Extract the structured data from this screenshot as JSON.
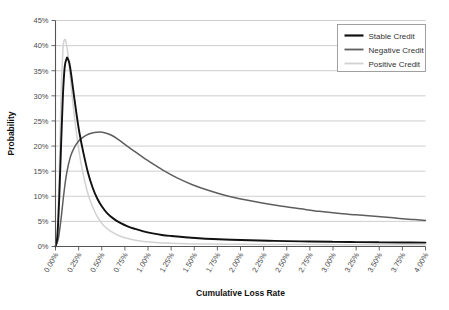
{
  "chart_data": {
    "type": "line",
    "title": "",
    "xlabel": "Cumulative Loss Rate",
    "ylabel": "Probability",
    "xlim": [
      0,
      4
    ],
    "ylim": [
      0,
      45
    ],
    "grid": "horizontal",
    "legend_position": "top-right",
    "x_tick_labels": [
      "0.00%",
      "0.25%",
      "0.50%",
      "0.75%",
      "1.00%",
      "1.25%",
      "1.50%",
      "1.75%",
      "2.00%",
      "2.25%",
      "2.50%",
      "2.75%",
      "3.00%",
      "3.25%",
      "3.50%",
      "3.75%",
      "4.00%"
    ],
    "x_tick_values": [
      0,
      0.25,
      0.5,
      0.75,
      1.0,
      1.25,
      1.5,
      1.75,
      2.0,
      2.25,
      2.5,
      2.75,
      3.0,
      3.25,
      3.5,
      3.75,
      4.0
    ],
    "y_tick_labels": [
      "0%",
      "5%",
      "10%",
      "15%",
      "20%",
      "25%",
      "30%",
      "35%",
      "40%",
      "45%"
    ],
    "y_tick_values": [
      0,
      5,
      10,
      15,
      20,
      25,
      30,
      35,
      40,
      45
    ],
    "series": [
      {
        "name": "Stable Credit",
        "color": "#111111",
        "width": 1.9,
        "peak_x": 0.13,
        "peak_y": 37.5,
        "x": [
          0.0,
          0.02,
          0.04,
          0.06,
          0.08,
          0.1,
          0.12,
          0.13,
          0.15,
          0.17,
          0.2,
          0.23,
          0.26,
          0.3,
          0.35,
          0.4,
          0.45,
          0.5,
          0.56,
          0.63,
          0.7,
          0.78,
          0.86,
          0.95,
          1.05,
          1.15,
          1.25,
          1.4,
          1.55,
          1.7,
          1.9,
          2.1,
          2.3,
          2.5,
          2.75,
          3.0,
          3.25,
          3.5,
          3.75,
          4.0
        ],
        "y": [
          0.0,
          2.0,
          9.5,
          20.0,
          30.0,
          35.8,
          37.4,
          37.5,
          36.5,
          34.2,
          30.0,
          26.0,
          22.5,
          18.8,
          14.8,
          11.8,
          9.6,
          8.0,
          6.6,
          5.5,
          4.7,
          4.0,
          3.5,
          3.0,
          2.6,
          2.3,
          2.1,
          1.85,
          1.65,
          1.5,
          1.35,
          1.25,
          1.15,
          1.08,
          1.0,
          0.93,
          0.88,
          0.83,
          0.8,
          0.78
        ]
      },
      {
        "name": "Negative Credit",
        "color": "#5e5e5e",
        "width": 1.5,
        "peak_x": 0.48,
        "peak_y": 22.8,
        "x": [
          0.0,
          0.03,
          0.06,
          0.09,
          0.12,
          0.16,
          0.2,
          0.25,
          0.3,
          0.36,
          0.42,
          0.48,
          0.54,
          0.6,
          0.68,
          0.76,
          0.85,
          0.95,
          1.05,
          1.18,
          1.32,
          1.48,
          1.65,
          1.85,
          2.05,
          2.25,
          2.45,
          2.65,
          2.85,
          3.05,
          3.25,
          3.45,
          3.65,
          3.85,
          4.0
        ],
        "y": [
          0.0,
          1.5,
          5.5,
          10.5,
          14.5,
          17.8,
          19.6,
          21.0,
          21.8,
          22.4,
          22.7,
          22.8,
          22.6,
          22.2,
          21.3,
          20.2,
          19.0,
          17.7,
          16.5,
          15.0,
          13.6,
          12.3,
          11.2,
          10.1,
          9.3,
          8.6,
          8.0,
          7.5,
          7.0,
          6.6,
          6.3,
          6.0,
          5.7,
          5.4,
          5.2
        ]
      },
      {
        "name": "Positive Credit",
        "color": "#d2d2d2",
        "width": 1.5,
        "peak_x": 0.1,
        "peak_y": 41.0,
        "x": [
          0.0,
          0.02,
          0.04,
          0.06,
          0.08,
          0.09,
          0.1,
          0.11,
          0.13,
          0.15,
          0.18,
          0.21,
          0.25,
          0.29,
          0.34,
          0.39,
          0.45,
          0.52,
          0.6,
          0.68,
          0.76,
          0.85,
          0.95,
          1.05,
          1.18,
          1.32,
          1.5,
          1.7,
          1.95,
          2.2,
          2.5,
          2.8,
          3.1,
          3.4,
          3.7,
          4.0
        ],
        "y": [
          0.0,
          3.0,
          14.0,
          30.0,
          39.0,
          40.8,
          41.2,
          41.0,
          39.0,
          35.5,
          30.0,
          25.0,
          19.5,
          15.2,
          11.2,
          8.4,
          6.0,
          4.2,
          3.0,
          2.2,
          1.7,
          1.3,
          1.0,
          0.85,
          0.7,
          0.6,
          0.52,
          0.48,
          0.45,
          0.42,
          0.4,
          0.38,
          0.37,
          0.36,
          0.35,
          0.34
        ]
      }
    ]
  },
  "legend": {
    "items": [
      {
        "label": "Stable Credit"
      },
      {
        "label": "Negative Credit"
      },
      {
        "label": "Positive Credit"
      }
    ]
  },
  "colors": {
    "background": "#ffffff",
    "gridline": "#b9b9b9",
    "axis": "#555555",
    "text": "#333333",
    "stable_credit": "#111111",
    "negative_credit": "#5e5e5e",
    "positive_credit": "#d2d2d2"
  }
}
